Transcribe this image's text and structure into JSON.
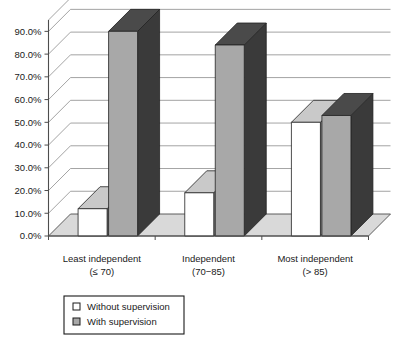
{
  "chart_data": {
    "type": "bar",
    "title": "",
    "subtitle": "",
    "xlabel": "",
    "ylabel": "",
    "grid": true,
    "three_d": true,
    "legend_position": "bottom-left",
    "ylim": [
      0,
      95
    ],
    "ytick_values": [
      0,
      10,
      20,
      30,
      40,
      50,
      60,
      70,
      80,
      90
    ],
    "ytick_labels": [
      "0.0%",
      "10.0%",
      "20.0%",
      "30.0%",
      "40.0%",
      "50.0%",
      "60.0%",
      "70.0%",
      "80.0%",
      "90.0%"
    ],
    "categories": [
      "Least independent",
      "Independent",
      "Most independent"
    ],
    "category_sublabels": [
      "(≤ 70)",
      "(70−85)",
      "(> 85)"
    ],
    "series": [
      {
        "name": "Without supervision",
        "color": "#ffffff",
        "values": [
          12,
          19,
          50
        ]
      },
      {
        "name": "With supervision",
        "color": "#a8a8a8",
        "values": [
          90,
          84,
          53
        ]
      }
    ]
  },
  "legend": {
    "items": [
      {
        "label": "Without supervision",
        "swatch": "white-square-icon"
      },
      {
        "label": "With supervision",
        "swatch": "gray-square-icon"
      }
    ]
  },
  "colors": {
    "bar_white_face": "#ffffff",
    "bar_white_side": "#8a8a8a",
    "bar_white_top": "#c9c9c9",
    "bar_gray_face": "#a8a8a8",
    "bar_gray_side": "#3a3a3a",
    "bar_gray_top": "#4a4a4a",
    "floor": "#d9d9d9",
    "grid": "#8c8c8c",
    "axis": "#4d4d4d",
    "text": "#1a1a1a",
    "legend_border": "#1a1a1a",
    "background": "#ffffff"
  }
}
